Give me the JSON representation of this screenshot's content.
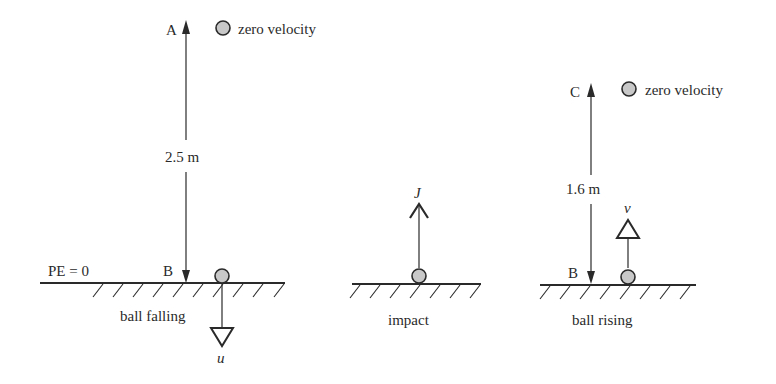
{
  "diagram": {
    "colors": {
      "ink": "#2a2a2a",
      "ball_fill": "#c8c8c8",
      "background": "#ffffff"
    },
    "panel_falling": {
      "top_point_label": "A",
      "top_ball_caption": "zero velocity",
      "height_label": "2.5 m",
      "reference_label": "PE = 0",
      "bottom_point_label": "B",
      "caption": "ball falling",
      "velocity_label": "u"
    },
    "panel_impact": {
      "impulse_label": "J",
      "caption": "impact"
    },
    "panel_rising": {
      "top_point_label": "C",
      "top_ball_caption": "zero velocity",
      "height_label": "1.6 m",
      "bottom_point_label": "B",
      "caption": "ball rising",
      "velocity_label": "v"
    }
  }
}
